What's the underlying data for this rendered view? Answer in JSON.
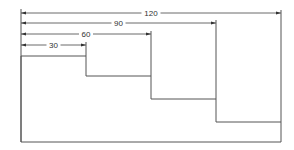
{
  "diagram": {
    "title": "",
    "units": "",
    "dimensions": [
      {
        "label": "30",
        "value": 30
      },
      {
        "label": "60",
        "value": 60
      },
      {
        "label": "90",
        "value": 90
      },
      {
        "label": "120",
        "value": 120
      }
    ],
    "steps": [
      {
        "width": 30,
        "level": 1
      },
      {
        "width": 60,
        "level": 2
      },
      {
        "width": 90,
        "level": 3
      },
      {
        "width": 120,
        "level": 4
      }
    ],
    "colors": {
      "line": "#555555",
      "background": "#ffffff"
    }
  }
}
